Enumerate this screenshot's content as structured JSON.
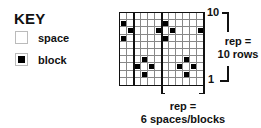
{
  "key": {
    "title": "KEY",
    "items": [
      {
        "label": "space",
        "type": "space"
      },
      {
        "label": "block",
        "type": "block"
      }
    ]
  },
  "chart": {
    "columns": 12,
    "rows": 10,
    "filled_cells_top_down": [
      [],
      [
        1,
        7
      ],
      [
        2,
        6,
        8,
        12
      ],
      [
        1,
        7
      ],
      [],
      [],
      [
        4,
        10
      ],
      [
        3,
        5,
        9,
        11
      ],
      [
        4,
        10
      ],
      []
    ],
    "row_label_top": "10",
    "row_label_bottom": "1"
  },
  "annotations": {
    "row_rep_line1": "rep =",
    "row_rep_line2": "10 rows",
    "col_rep_line1": "rep =",
    "col_rep_line2": "6 spaces/blocks"
  }
}
